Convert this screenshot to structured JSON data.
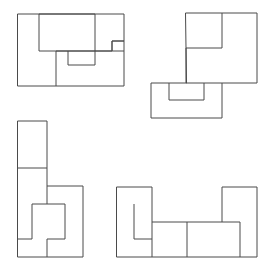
{
  "page": {
    "background_color": "#ffffff",
    "stroke_color": "#4a4a4a",
    "fill_color": "#ffffff",
    "stroke_width": 1,
    "width": 271,
    "height": 270,
    "figure_count": 4
  },
  "figures": [
    {
      "id": "figure-top-left",
      "name": "rectangle-dissection",
      "label": "Figure 1",
      "position": "top-left",
      "outline_name": "rectangle-outline",
      "outline": "M 18 14 L 124 14 L 124 86 L 18 86 Z",
      "bounds": {
        "x": 18,
        "y": 14,
        "width": 106,
        "height": 72
      },
      "pieces": [
        {
          "name": "piece-upper-rectangle",
          "d": "M 39 14 L 95 14 L 95 51 L 39 51 Z"
        },
        {
          "name": "piece-lower-left-divider",
          "d": "M 56 51 L 56 86"
        },
        {
          "name": "piece-notched-block",
          "d": "M 95 51 L 95 51 L 112 51 L 112 41 L 124 41 M 56 51 L 124 51 M 68 51 L 68 65 L 95 65 L 95 51"
        },
        {
          "name": "piece-step-outline",
          "d": "M 112 51 L 112 41 L 124 41"
        }
      ]
    },
    {
      "id": "figure-top-right",
      "name": "s-shaped-dissection",
      "label": "Figure 2",
      "position": "top-right",
      "outline_name": "s-shape-outline",
      "outline": "M 186 13 L 257 13 L 257 83 L 222 83 L 222 118 L 151 118 L 151 83 L 186 83 Z",
      "bounds": {
        "x": 151,
        "y": 13,
        "width": 106,
        "height": 105
      },
      "pieces": [
        {
          "name": "piece-top-bar",
          "d": "M 186 48 L 222 48 L 222 13"
        },
        {
          "name": "piece-middle-divider",
          "d": "M 186 48 L 186 83 L 222 83"
        },
        {
          "name": "piece-notch-lower",
          "d": "M 169 83 L 169 100 L 204 100 L 204 83"
        }
      ]
    },
    {
      "id": "figure-bottom-left",
      "name": "vertical-l-dissection",
      "label": "Figure 3",
      "position": "bottom-left",
      "outline_name": "vertical-l-outline",
      "outline": "M 18 121 L 47 121 L 47 186 L 83 186 L 83 257 L 18 257 Z",
      "bounds": {
        "x": 18,
        "y": 121,
        "width": 65,
        "height": 136
      },
      "pieces": [
        {
          "name": "piece-top-cell-divider",
          "d": "M 18 168 L 47 168"
        },
        {
          "name": "piece-inner-block",
          "d": "M 32 204 L 65 204 L 65 239 L 47 239 L 47 257 M 32 204 L 32 239 L 18 239"
        },
        {
          "name": "piece-vertical-spine",
          "d": "M 47 186 L 47 204"
        }
      ]
    },
    {
      "id": "figure-bottom-right",
      "name": "horizontal-u-dissection",
      "label": "Figure 4",
      "position": "bottom-right",
      "outline_name": "horizontal-u-outline",
      "outline": "M 117 187 L 152 187 L 152 222 L 222 222 L 222 187 L 257 187 L 257 257 L 117 257 Z",
      "bounds": {
        "x": 117,
        "y": 187,
        "width": 140,
        "height": 70
      },
      "pieces": [
        {
          "name": "piece-inner-hook",
          "d": "M 134 204 L 134 239 L 152 239"
        },
        {
          "name": "piece-center-divider",
          "d": "M 187 222 L 187 257"
        },
        {
          "name": "piece-right-step",
          "d": "M 222 222 L 240 222 L 240 257"
        },
        {
          "name": "piece-left-divider",
          "d": "M 152 222 L 152 257"
        }
      ]
    }
  ]
}
